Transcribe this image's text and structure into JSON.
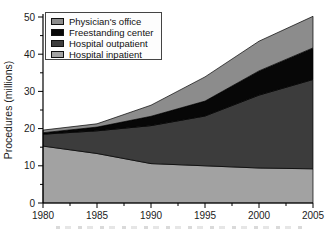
{
  "figure": {
    "y_axis_label": "Procedures (millions)",
    "y_ticks": [
      0,
      10,
      20,
      30,
      40,
      50
    ],
    "x_ticks": [
      1980,
      1985,
      1990,
      1995,
      2000,
      2005
    ]
  },
  "legend": {
    "items": [
      {
        "label": "Physician's office",
        "color": "#8c8c8c"
      },
      {
        "label": "Freestanding center",
        "color": "#070707"
      },
      {
        "label": "Hospital outpatient",
        "color": "#3c3c3c"
      },
      {
        "label": "Hospital inpatient",
        "color": "#a2a2a2"
      }
    ]
  },
  "chart_data": {
    "type": "area",
    "stacked": true,
    "title": "",
    "xlabel": "",
    "ylabel": "Procedures (millions)",
    "x": [
      1980,
      1985,
      1990,
      1995,
      2000,
      2005
    ],
    "xlim": [
      1980,
      2005
    ],
    "ylim": [
      0,
      50
    ],
    "grid": false,
    "legend_position": "upper-left",
    "series": [
      {
        "name": "Hospital inpatient",
        "color": "#a2a2a2",
        "values": [
          15.3,
          13.3,
          10.6,
          10.0,
          9.4,
          9.2
        ]
      },
      {
        "name": "Hospital outpatient",
        "color": "#3c3c3c",
        "values": [
          3.2,
          6.1,
          10.2,
          13.4,
          19.6,
          24.0
        ]
      },
      {
        "name": "Freestanding center",
        "color": "#070707",
        "values": [
          0.4,
          1.0,
          2.5,
          4.0,
          6.5,
          8.5
        ]
      },
      {
        "name": "Physician's office",
        "color": "#8c8c8c",
        "values": [
          0.7,
          0.9,
          3.0,
          6.5,
          8.0,
          8.5
        ]
      }
    ]
  }
}
